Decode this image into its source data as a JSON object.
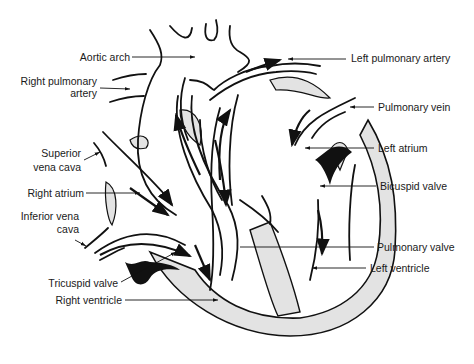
{
  "diagram": {
    "colors": {
      "line": "#111111",
      "tissue": "#e3e3e3",
      "valve": "#111111",
      "background": "#ffffff"
    },
    "labels": {
      "aortic_arch": "Aortic arch",
      "right_pulmonary_artery_1": "Right pulmonary",
      "right_pulmonary_artery_2": "artery",
      "superior_vena_cava_1": "Superior",
      "superior_vena_cava_2": "vena cava",
      "right_atrium": "Right atrium",
      "inferior_vena_cava_1": "Inferior vena",
      "inferior_vena_cava_2": "cava",
      "tricuspid_valve": "Tricuspid valve",
      "right_ventricle": "Right ventricle",
      "left_pulmonary_artery": "Left pulmonary artery",
      "pulmonary_vein": "Pulmonary vein",
      "left_atrium": "Left atrium",
      "bicuspid_valve": "Bicuspid valve",
      "pulmonary_valve": "Pulmonary valve",
      "left_ventricle": "Left ventricle"
    }
  }
}
